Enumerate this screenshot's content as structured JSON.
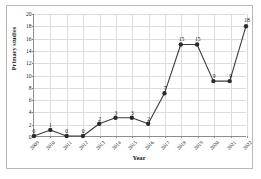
{
  "chart_data": {
    "type": "line",
    "title": "",
    "xlabel": "Year",
    "ylabel": "Primary studies",
    "categories": [
      "2009",
      "2010",
      "2011",
      "2012",
      "2013",
      "2014",
      "2015",
      "2016",
      "2017",
      "2018",
      "2019",
      "2020",
      "2021",
      "2022"
    ],
    "values": [
      0,
      1,
      0,
      0,
      2,
      3,
      3,
      2,
      7,
      15,
      15,
      9,
      9,
      18
    ],
    "point_labels": [
      "0",
      "1",
      "0",
      "0",
      "2",
      "3",
      "3",
      "2",
      "7",
      "15",
      "15",
      "9",
      "9",
      "18"
    ],
    "ylim": [
      0,
      20
    ],
    "yticks": [
      0,
      2,
      4,
      6,
      8,
      10,
      12,
      14,
      16,
      18,
      20
    ],
    "ytick_labels": [
      "0",
      "2",
      "4",
      "6",
      "8",
      "10",
      "12",
      "14",
      "16",
      "18",
      "20"
    ],
    "grid": true,
    "legend": "none",
    "series_color": "#3a3a3a",
    "marker_color": "#2b2b2b",
    "grid_color": "#dcdcdc",
    "axis_color": "#8d8d8d",
    "frame_color": "#b9b9b9",
    "background": "#ffffff"
  }
}
